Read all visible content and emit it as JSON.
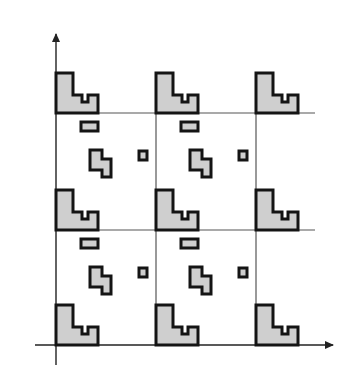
{
  "diagram": {
    "colors": {
      "background": "#ffffff",
      "shape_fill": "#cfcfcf",
      "shape_stroke": "#141414",
      "grid_line": "#555555",
      "axis": "#222222"
    },
    "axes": {
      "origin": [
        56,
        345
      ],
      "x_axis_end": [
        335,
        345
      ],
      "y_axis_end": [
        56,
        35
      ]
    },
    "grid": {
      "vertical_x": [
        56,
        156,
        256
      ],
      "horizontal_y": [
        113,
        230,
        345
      ],
      "cell_width": 100,
      "cell_height": 116
    },
    "motif": {
      "large_L_shape": "corner shape at every lattice point",
      "small_bar": "horizontal rounded rectangle below lattice line",
      "tetromino": "S-like polyomino in cell center",
      "tiny_square": "small square right of tetromino"
    },
    "lattice_points": [
      [
        56,
        113
      ],
      [
        156,
        113
      ],
      [
        256,
        113
      ],
      [
        56,
        230
      ],
      [
        156,
        230
      ],
      [
        256,
        230
      ],
      [
        56,
        345
      ],
      [
        156,
        345
      ],
      [
        256,
        345
      ]
    ],
    "cells": [
      [
        56,
        113
      ],
      [
        156,
        113
      ],
      [
        56,
        230
      ],
      [
        156,
        230
      ]
    ]
  }
}
